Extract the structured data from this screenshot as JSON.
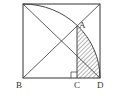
{
  "diagram": {
    "type": "geometry",
    "labels": {
      "A": "A",
      "B": "B",
      "C": "C",
      "D": "D"
    },
    "colors": {
      "stroke": "#333333",
      "hatch": "#444444",
      "background": "#ffffff"
    }
  }
}
